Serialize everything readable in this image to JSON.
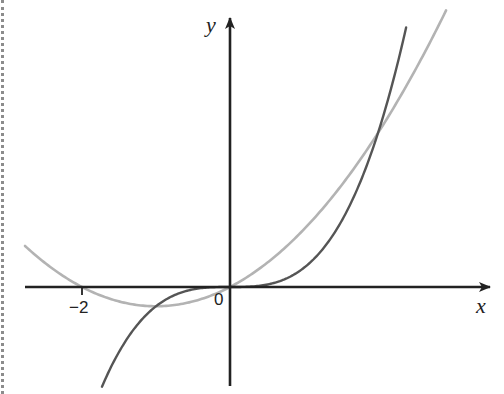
{
  "chart_data": {
    "type": "line",
    "title": "",
    "xlabel": "x",
    "ylabel": "y",
    "origin_label": "0",
    "x_ticks": [
      {
        "value": -2,
        "label": "−2"
      }
    ],
    "xlim": [
      -2.78,
      3.55
    ],
    "ylim": [
      -5.2,
      14.8
    ],
    "grid": false,
    "legend": null,
    "series": [
      {
        "name": "y = x^3",
        "color": "#555555",
        "x": [
          -1.73,
          -1.5,
          -1,
          -0.5,
          0,
          0.5,
          1,
          1.5,
          2,
          2.38
        ],
        "y": [
          -5.18,
          -3.38,
          -1,
          -0.13,
          0,
          0.13,
          1,
          3.38,
          8,
          13.48
        ]
      },
      {
        "name": "y = x^2 + 2x",
        "color": "#b3b3b3",
        "x": [
          -2.77,
          -2.5,
          -2,
          -1.5,
          -1,
          -0.5,
          0,
          0.5,
          1,
          1.5,
          2,
          2.5,
          2.92
        ],
        "y": [
          2.13,
          1.25,
          0,
          -0.75,
          -1,
          -0.75,
          0,
          1.25,
          3,
          5.25,
          8,
          11.25,
          14.37
        ]
      }
    ],
    "annotations": [
      {
        "type": "intersection",
        "x": -1,
        "y": -1
      },
      {
        "type": "intersection",
        "x": 0,
        "y": 0
      },
      {
        "type": "intersection",
        "x": 2,
        "y": 8
      }
    ]
  },
  "labels": {
    "x_axis": "x",
    "y_axis": "y",
    "origin": "0",
    "tick_neg2": "−2"
  },
  "colors": {
    "axis": "#222222",
    "cubic": "#555555",
    "quadratic": "#b3b3b3"
  }
}
